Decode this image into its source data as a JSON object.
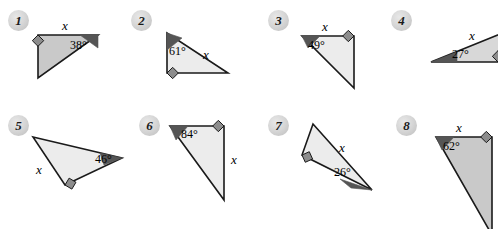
{
  "page": {
    "background_color": "#ffffff",
    "width": 498,
    "height": 229
  },
  "colors": {
    "outline": "#1a1a1a",
    "fill_dark": "#c9c9c9",
    "fill_light": "#ececec",
    "fill_mid": "#d8d8d8",
    "angle_wedge": "#555555",
    "right_angle_marker": "#8d8d8d",
    "badge_fill": "#d6d6d6",
    "text": "#000000"
  },
  "figures": [
    {
      "number": "1",
      "badge": {
        "x": 8,
        "y": 10
      },
      "fill": "#c9c9c9",
      "points": "38,35 98,35 38,78",
      "right_angle": {
        "x": 38,
        "y": 35,
        "dx": 1,
        "dy": 1
      },
      "wedge": {
        "points": "98,35 80,35 98,48"
      },
      "labels": [
        {
          "text": "x",
          "kind": "x",
          "x": 62,
          "y": 18
        },
        {
          "text": "38°",
          "kind": "angle",
          "x": 70,
          "y": 38
        }
      ]
    },
    {
      "number": "2",
      "badge": {
        "x": 131,
        "y": 10
      },
      "fill": "#ececec",
      "points": "167,33 167,73 228,73",
      "right_angle": {
        "x": 167,
        "y": 73,
        "dx": 1,
        "dy": -1
      },
      "wedge": {
        "points": "167,33 167,50 182,38"
      },
      "labels": [
        {
          "text": "x",
          "kind": "x",
          "x": 203,
          "y": 47
        },
        {
          "text": "61°",
          "kind": "angle",
          "x": 169,
          "y": 44
        }
      ]
    },
    {
      "number": "3",
      "badge": {
        "x": 268,
        "y": 10
      },
      "fill": "#ececec",
      "points": "302,36 354,36 354,88",
      "right_angle": {
        "x": 354,
        "y": 36,
        "dx": -1,
        "dy": 1
      },
      "wedge": {
        "points": "302,36 320,36 308,48"
      },
      "labels": [
        {
          "text": "x",
          "kind": "x",
          "x": 322,
          "y": 19
        },
        {
          "text": "49°",
          "kind": "angle",
          "x": 308,
          "y": 38
        }
      ]
    },
    {
      "number": "4",
      "badge": {
        "x": 391,
        "y": 10
      },
      "fill": "#d8d8d8",
      "points": "431,62 510,30 510,62",
      "right_angle": {
        "x": 498,
        "y": 62,
        "dx": -1,
        "dy": -1
      },
      "wedge": {
        "points": "431,62 457,62 457,52"
      },
      "labels": [
        {
          "text": "x",
          "kind": "x",
          "x": 469,
          "y": 28
        },
        {
          "text": "27°",
          "kind": "angle",
          "x": 452,
          "y": 47
        }
      ]
    },
    {
      "number": "5",
      "badge": {
        "x": 8,
        "y": 115
      },
      "fill": "#ececec",
      "points": "33,137 122,158 65,185",
      "right_angle": {
        "x": 65,
        "y": 185,
        "dx": 0.6,
        "dy": -1
      },
      "wedge": {
        "points": "122,158 100,153 104,165"
      },
      "labels": [
        {
          "text": "x",
          "kind": "x",
          "x": 36,
          "y": 162
        },
        {
          "text": "46°",
          "kind": "angle",
          "x": 95,
          "y": 152
        }
      ]
    },
    {
      "number": "6",
      "badge": {
        "x": 139,
        "y": 115
      },
      "fill": "#ececec",
      "points": "170,126 224,126 224,200",
      "right_angle": {
        "x": 224,
        "y": 126,
        "dx": -1,
        "dy": 1
      },
      "wedge": {
        "points": "170,126 188,126 176,140"
      },
      "labels": [
        {
          "text": "84°",
          "kind": "angle",
          "x": 181,
          "y": 127
        },
        {
          "text": "x",
          "kind": "x",
          "x": 231,
          "y": 152
        }
      ]
    },
    {
      "number": "7",
      "badge": {
        "x": 268,
        "y": 115
      },
      "fill": "#ececec",
      "points": "313,124 372,190 302,155",
      "right_angle": {
        "x": 302,
        "y": 155,
        "dx": 1,
        "dy": -0.45
      },
      "wedge": {
        "points": "372,190 340,179 351,188"
      },
      "labels": [
        {
          "text": "x",
          "kind": "x",
          "x": 339,
          "y": 140
        },
        {
          "text": "26°",
          "kind": "angle",
          "x": 334,
          "y": 165
        }
      ]
    },
    {
      "number": "8",
      "badge": {
        "x": 396,
        "y": 115
      },
      "fill": "#c9c9c9",
      "points": "436,137 492,137 492,235",
      "right_angle": {
        "x": 492,
        "y": 137,
        "dx": -1,
        "dy": 1
      },
      "wedge": {
        "points": "436,137 454,137 442,150"
      },
      "labels": [
        {
          "text": "x",
          "kind": "x",
          "x": 456,
          "y": 120
        },
        {
          "text": "62°",
          "kind": "angle",
          "x": 443,
          "y": 139
        }
      ]
    }
  ]
}
